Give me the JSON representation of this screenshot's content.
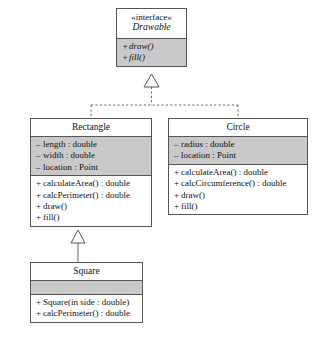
{
  "diagram": {
    "type": "class-diagram",
    "classes": [
      {
        "id": "drawable",
        "stereotype": "«interface»",
        "name": "Drawable",
        "attributes": [],
        "operations": [
          {
            "visibility": "+",
            "text": "draw()"
          },
          {
            "visibility": "+",
            "text": "fill()"
          }
        ]
      },
      {
        "id": "rectangle",
        "stereotype": "",
        "name": "Rectangle",
        "attributes": [
          {
            "visibility": "–",
            "text": "length : double"
          },
          {
            "visibility": "–",
            "text": "width : double"
          },
          {
            "visibility": "–",
            "text": "location : Point"
          }
        ],
        "operations": [
          {
            "visibility": "+",
            "text": "calculateArea() : double"
          },
          {
            "visibility": "+",
            "text": "calcPerimeter() : double"
          },
          {
            "visibility": "+",
            "text": "draw()"
          },
          {
            "visibility": "+",
            "text": "fill()"
          }
        ]
      },
      {
        "id": "circle",
        "stereotype": "",
        "name": "Circle",
        "attributes": [
          {
            "visibility": "–",
            "text": "radius : double"
          },
          {
            "visibility": "–",
            "text": "location : Point"
          }
        ],
        "operations": [
          {
            "visibility": "+",
            "text": "calculateArea() : double"
          },
          {
            "visibility": "+",
            "text": "calcCircumference() : double"
          },
          {
            "visibility": "+",
            "text": "draw()"
          },
          {
            "visibility": "+",
            "text": "fill()"
          }
        ]
      },
      {
        "id": "square",
        "stereotype": "",
        "name": "Square",
        "attributes": [],
        "operations": [
          {
            "visibility": "+",
            "text": "Square(in side : double)"
          },
          {
            "visibility": "+",
            "text": "calcPerimeter() : double"
          }
        ]
      }
    ],
    "relationships": [
      {
        "kind": "realization",
        "from": "Rectangle",
        "to": "Drawable",
        "line": "dashed",
        "arrow": "hollow-triangle"
      },
      {
        "kind": "realization",
        "from": "Circle",
        "to": "Drawable",
        "line": "dashed",
        "arrow": "hollow-triangle"
      },
      {
        "kind": "generalization",
        "from": "Square",
        "to": "Rectangle",
        "line": "solid",
        "arrow": "hollow-triangle"
      }
    ],
    "colors": {
      "border": "#555555",
      "shaded_compartment": "#c9c9c9",
      "background": "#ffffff",
      "text": "#111111"
    }
  }
}
